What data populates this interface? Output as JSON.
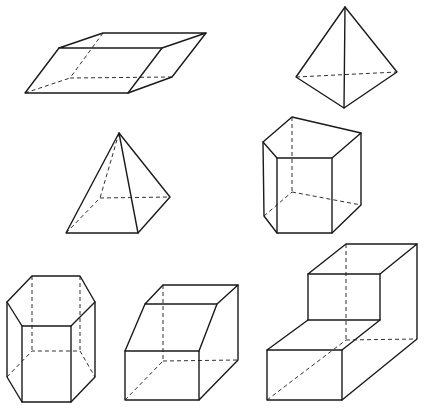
{
  "diagram": {
    "title": "",
    "background": "#ffffff",
    "stroke_color": "#1a1a1a",
    "shapes": [
      {
        "id": "parallelepiped",
        "name": "Oblique parallelepiped",
        "solid": [
          [
            [
              59,
              48
            ],
            [
              103,
              33
            ],
            [
              206,
              33
            ],
            [
              162,
              48
            ],
            [
              59,
              48
            ]
          ],
          [
            [
              59,
              48
            ],
            [
              25,
              93
            ],
            [
              128,
              93
            ],
            [
              162,
              48
            ]
          ],
          [
            [
              128,
              93
            ],
            [
              172,
              77
            ],
            [
              206,
              33
            ]
          ]
        ],
        "hidden": [
          [
            [
              103,
              33
            ],
            [
              70,
              78
            ]
          ],
          [
            [
              25,
              93
            ],
            [
              70,
              78
            ]
          ],
          [
            [
              70,
              78
            ],
            [
              172,
              77
            ]
          ]
        ]
      },
      {
        "id": "tetrahedron",
        "name": "Tetrahedron",
        "solid": [
          [
            [
              345,
              7
            ],
            [
              296,
              77
            ],
            [
              344,
              108
            ],
            [
              397,
              72
            ],
            [
              345,
              7
            ]
          ],
          [
            [
              345,
              7
            ],
            [
              344,
              108
            ]
          ]
        ],
        "hidden": [
          [
            [
              296,
              77
            ],
            [
              397,
              72
            ]
          ]
        ]
      },
      {
        "id": "square-pyramid",
        "name": "Square pyramid",
        "solid": [
          [
            [
              119,
              133
            ],
            [
              66,
              233
            ],
            [
              138,
              233
            ],
            [
              170,
              197
            ],
            [
              119,
              133
            ]
          ],
          [
            [
              119,
              133
            ],
            [
              138,
              233
            ]
          ]
        ],
        "hidden": [
          [
            [
              119,
              133
            ],
            [
              100,
              198
            ]
          ],
          [
            [
              66,
              233
            ],
            [
              100,
              198
            ]
          ],
          [
            [
              100,
              198
            ],
            [
              170,
              197
            ]
          ]
        ]
      },
      {
        "id": "pentagonal-prism",
        "name": "Pentagonal prism",
        "solid": [
          [
            [
              292,
              117
            ],
            [
              361,
              133
            ],
            [
              332,
              158
            ],
            [
              277,
              158
            ],
            [
              263,
              142
            ],
            [
              292,
              117
            ]
          ],
          [
            [
              263,
              142
            ],
            [
              264,
              216
            ],
            [
              277,
              233
            ],
            [
              332,
              233
            ],
            [
              361,
              205
            ],
            [
              361,
              133
            ]
          ],
          [
            [
              277,
              158
            ],
            [
              277,
              233
            ]
          ],
          [
            [
              332,
              158
            ],
            [
              332,
              233
            ]
          ]
        ],
        "hidden": [
          [
            [
              292,
              117
            ],
            [
              292,
              192
            ]
          ],
          [
            [
              264,
              216
            ],
            [
              292,
              192
            ]
          ],
          [
            [
              292,
              192
            ],
            [
              361,
              205
            ]
          ]
        ]
      },
      {
        "id": "hexagonal-prism",
        "name": "Hexagonal prism",
        "solid": [
          [
            [
              32,
              276
            ],
            [
              80,
              276
            ],
            [
              95,
              302
            ],
            [
              71,
              326
            ],
            [
              22,
              326
            ],
            [
              7,
              302
            ],
            [
              32,
              276
            ]
          ],
          [
            [
              7,
              302
            ],
            [
              7,
              377
            ],
            [
              22,
              402
            ],
            [
              71,
              402
            ],
            [
              95,
              377
            ],
            [
              95,
              302
            ]
          ],
          [
            [
              22,
              326
            ],
            [
              22,
              402
            ]
          ],
          [
            [
              71,
              326
            ],
            [
              71,
              402
            ]
          ]
        ],
        "hidden": [
          [
            [
              32,
              276
            ],
            [
              32,
              351
            ]
          ],
          [
            [
              80,
              276
            ],
            [
              80,
              351
            ]
          ],
          [
            [
              7,
              377
            ],
            [
              32,
              351
            ],
            [
              80,
              351
            ],
            [
              95,
              377
            ]
          ]
        ]
      },
      {
        "id": "sheared-block",
        "name": "Truncated oblique prism",
        "solid": [
          [
            [
              163,
              285
            ],
            [
              238,
              285
            ],
            [
              217,
              304
            ],
            [
              145,
              304
            ],
            [
              163,
              285
            ]
          ],
          [
            [
              145,
              304
            ],
            [
              125,
              351
            ],
            [
              199,
              351
            ],
            [
              217,
              304
            ]
          ],
          [
            [
              125,
              351
            ],
            [
              125,
              400
            ],
            [
              199,
              400
            ],
            [
              199,
              351
            ]
          ],
          [
            [
              199,
              400
            ],
            [
              238,
              360
            ],
            [
              238,
              285
            ]
          ]
        ],
        "hidden": [
          [
            [
              163,
              285
            ],
            [
              163,
              361
            ]
          ],
          [
            [
              125,
              400
            ],
            [
              163,
              361
            ]
          ],
          [
            [
              163,
              361
            ],
            [
              238,
              360
            ]
          ]
        ]
      },
      {
        "id": "step-block",
        "name": "L-shaped step block",
        "solid": [
          [
            [
              308,
              274
            ],
            [
              346,
              244
            ],
            [
              417,
              244
            ],
            [
              380,
              274
            ],
            [
              308,
              274
            ]
          ],
          [
            [
              308,
              274
            ],
            [
              308,
              320
            ],
            [
              380,
              320
            ],
            [
              380,
              274
            ]
          ],
          [
            [
              308,
              320
            ],
            [
              267,
              350
            ],
            [
              342,
              350
            ],
            [
              380,
              320
            ]
          ],
          [
            [
              267,
              350
            ],
            [
              267,
              400
            ],
            [
              342,
              400
            ],
            [
              342,
              350
            ]
          ],
          [
            [
              342,
              400
            ],
            [
              417,
              339
            ],
            [
              417,
              244
            ]
          ]
        ],
        "hidden": [
          [
            [
              346,
              244
            ],
            [
              346,
              340
            ]
          ],
          [
            [
              267,
              400
            ],
            [
              346,
              340
            ]
          ],
          [
            [
              346,
              340
            ],
            [
              417,
              339
            ]
          ]
        ]
      }
    ]
  }
}
